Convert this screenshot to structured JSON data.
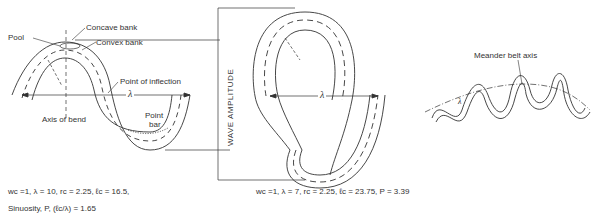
{
  "figure_a": {
    "labels": {
      "pool": "Pool",
      "concave_bank": "Concave bank",
      "convex_bank": "Convex bank",
      "point_of_inflection": "Point of inflection",
      "axis_of_bend": "Axis of bend",
      "point_bar_1": "Point",
      "point_bar_2": "bar",
      "lambda": "λ"
    },
    "caption": {
      "line1": "wc =1,  λ = 10,  rc = 2.25,  ℓc = 16.5,",
      "line2": "Sinuosity, P, (ℓc/λ) = 1.65"
    }
  },
  "figure_b": {
    "labels": {
      "wave_amplitude": "WAVE AMPLITUDE",
      "lambda": "λ"
    },
    "caption": "wc =1,  λ = 7,  rc = 2.25,  ℓc = 23.75,  P = 3.39"
  },
  "figure_c": {
    "labels": {
      "meander_belt_axis": "Meander belt axis",
      "lambda": "λ"
    }
  }
}
